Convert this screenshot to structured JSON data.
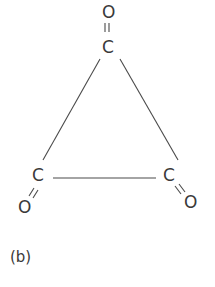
{
  "figure": {
    "caption": "(b)",
    "molecule": {
      "atoms": [
        {
          "id": "O_top",
          "label": "O"
        },
        {
          "id": "C_top",
          "label": "C"
        },
        {
          "id": "C_left",
          "label": "C"
        },
        {
          "id": "O_left",
          "label": "O"
        },
        {
          "id": "C_right",
          "label": "C"
        },
        {
          "id": "O_right",
          "label": "O"
        }
      ],
      "bonds": [
        {
          "from": "C_top",
          "to": "O_top",
          "order": 2
        },
        {
          "from": "C_left",
          "to": "O_left",
          "order": 2
        },
        {
          "from": "C_right",
          "to": "O_right",
          "order": 2
        },
        {
          "from": "C_top",
          "to": "C_left",
          "order": 1
        },
        {
          "from": "C_top",
          "to": "C_right",
          "order": 1
        },
        {
          "from": "C_left",
          "to": "C_right",
          "order": 1
        }
      ]
    },
    "line_color": "#4a4a4a"
  }
}
